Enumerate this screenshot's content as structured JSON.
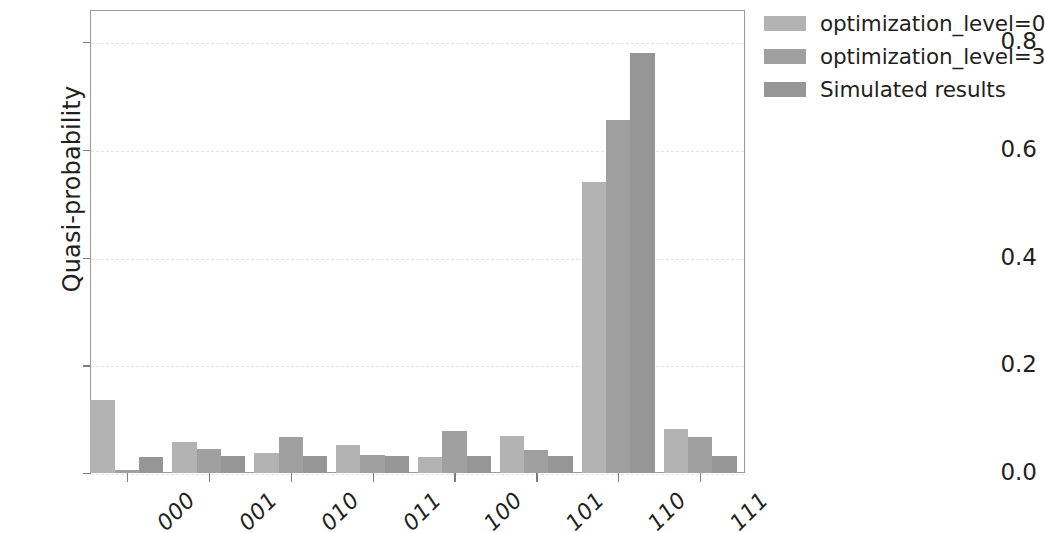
{
  "chart_data": {
    "type": "bar",
    "title": "",
    "xlabel": "",
    "ylabel": "Quasi-probability",
    "categories": [
      "000",
      "001",
      "010",
      "011",
      "100",
      "101",
      "110",
      "111"
    ],
    "ylim": [
      0.0,
      0.86
    ],
    "yticks": [
      0.0,
      0.2,
      0.4,
      0.6,
      0.8
    ],
    "ytick_labels": [
      "0.0",
      "0.2",
      "0.4",
      "0.6",
      "0.8"
    ],
    "grid": true,
    "legend_position": "upper right outside",
    "series": [
      {
        "name": "optimization_level=0",
        "color": "#b3b3b3",
        "values": [
          0.135,
          0.057,
          0.038,
          0.052,
          0.03,
          0.069,
          0.541,
          0.081
        ]
      },
      {
        "name": "optimization_level=3",
        "color": "#a0a0a0",
        "values": [
          0.005,
          0.044,
          0.067,
          0.033,
          0.078,
          0.043,
          0.656,
          0.066
        ]
      },
      {
        "name": "Simulated results",
        "color": "#969696",
        "values": [
          0.03,
          0.032,
          0.032,
          0.032,
          0.032,
          0.032,
          0.781,
          0.032
        ]
      }
    ]
  },
  "axes": {
    "frame_color": "#9a9a9a",
    "tick_color": "#7d7d7d",
    "grid_color": "#e3e3e3",
    "text_color": "#231f20"
  },
  "legend": {
    "entries": [
      {
        "label": "optimization_level=0",
        "swatch": "#b3b3b3"
      },
      {
        "label": "optimization_level=3",
        "swatch": "#a0a0a0"
      },
      {
        "label": "Simulated results",
        "swatch": "#969696"
      }
    ]
  }
}
